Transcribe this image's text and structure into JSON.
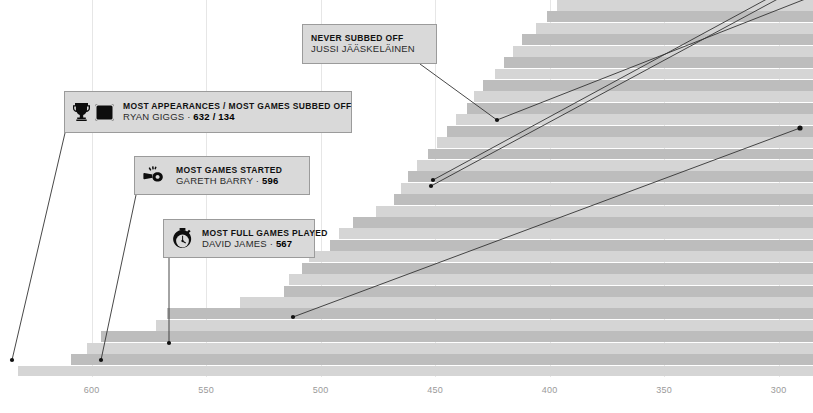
{
  "chart_data": {
    "type": "bar",
    "orientation": "horizontal",
    "title": "",
    "xlabel": "",
    "ylabel": "",
    "grid": true,
    "legend_position": "none",
    "xlim": [
      640,
      285
    ],
    "axis_direction": "descending",
    "tick_labels": [
      "600",
      "550",
      "500",
      "450",
      "400",
      "350",
      "300"
    ],
    "tick_values": [
      600,
      550,
      500,
      450,
      400,
      350,
      300
    ],
    "note": "Premier League all-time appearance leaders; each row is one player, bar length = appearances",
    "values": [
      632,
      609,
      602,
      596,
      572,
      567,
      535,
      516,
      514,
      508,
      505,
      496,
      492,
      486,
      476,
      468,
      465,
      462,
      458,
      453,
      449,
      445,
      441,
      436,
      433,
      429,
      424,
      420,
      416,
      412,
      406,
      401,
      397
    ]
  },
  "callouts": [
    {
      "id": "jussi",
      "headline": "NEVER SUBBED OFF",
      "subject": "JUSSI JÄÄSKELÄINEN",
      "value": "",
      "icons": []
    },
    {
      "id": "giggs",
      "headline": "MOST APPEARANCES / MOST GAMES SUBBED OFF",
      "subject": "RYAN GIGGS ·",
      "value": "632 / 134",
      "icons": [
        "trophy-icon",
        "substitution-board-icon"
      ]
    },
    {
      "id": "barry",
      "headline": "MOST GAMES STARTED",
      "subject": "GARETH BARRY ·",
      "value": "596",
      "icons": [
        "whistle-icon"
      ]
    },
    {
      "id": "james",
      "headline": "MOST FULL GAMES PLAYED",
      "subject": "DAVID JAMES ·",
      "value": "567",
      "icons": [
        "stopwatch-icon"
      ]
    }
  ],
  "colors": {
    "bar_light": "#d5d5d5",
    "bar_dark": "#bdbdbd",
    "callout_bg": "#d9d9d9",
    "callout_border": "#9b9b9b",
    "tick_text": "#9a9a9a",
    "leader_line": "#333333",
    "background": "#ffffff"
  }
}
